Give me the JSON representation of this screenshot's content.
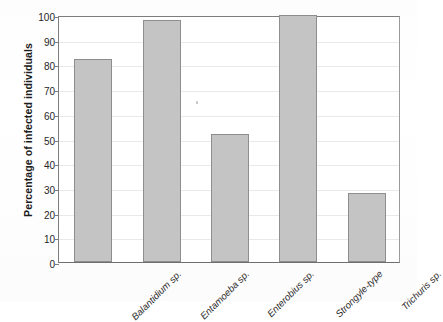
{
  "chart_data": {
    "type": "bar",
    "title": "",
    "xlabel": "",
    "ylabel": "Percentage of infected individuals",
    "categories": [
      "Balantidium sp.",
      "Entamoeba sp.",
      "Enterobius sp.",
      "Strongyle-type",
      "Trichuris sp."
    ],
    "values": [
      82,
      98,
      52,
      100,
      28
    ],
    "ylim": [
      0,
      100
    ],
    "yticks": [
      0,
      10,
      20,
      30,
      40,
      50,
      60,
      70,
      80,
      90,
      100
    ],
    "ytick_labels": [
      "0",
      "10",
      "20",
      "30",
      "40",
      "50",
      "60",
      "70",
      "80",
      "90",
      "100"
    ],
    "grid": true,
    "legend": false,
    "legend_position": "none",
    "bar_color": "#c4c4c4",
    "bar_edge_color": "#8e8e8e",
    "axis_color": "#7d7d7d",
    "gridline_color": "#e9e9e9",
    "background_color": "#ffffff",
    "xtick_rotation": -45,
    "xtick_style": "italic"
  }
}
